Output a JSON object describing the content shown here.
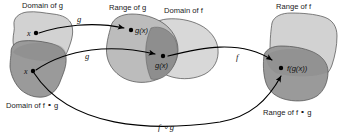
{
  "figure": {
    "background": "#ffffff"
  },
  "colors": {
    "blob_light": "#d2d2d2",
    "blob_medium": "#bcbcbc",
    "blob_dark": "#9a9a9a",
    "blob_overlap": "#8e8e8e",
    "outline": "#4a4a4a",
    "arrow": "#000000",
    "text": "#111111"
  },
  "sets": [
    {
      "id": "domain-of-g",
      "label": "Domain of g",
      "label_position": "top",
      "shade": "light",
      "point": "x"
    },
    {
      "id": "domain-of-f-comp-g",
      "label": "Domain of f ∘ g",
      "label_position": "bottom",
      "shade": "dark",
      "point": "x"
    },
    {
      "id": "range-of-g",
      "label": "Range of g",
      "label_position": "top",
      "shade": "medium",
      "point": "g(x)"
    },
    {
      "id": "domain-of-f",
      "label": "Domain of f",
      "label_position": "top",
      "shade": "light",
      "point": "g(x)"
    },
    {
      "id": "range-of-f",
      "label": "Range of f",
      "label_position": "top",
      "shade": "light",
      "point": ""
    },
    {
      "id": "range-of-f-comp-g",
      "label": "Range of f ∘ g",
      "label_position": "bottom",
      "shade": "dark",
      "point": "f(g(x))"
    }
  ],
  "points": [
    {
      "id": "x-upper",
      "label": "x",
      "x": 34,
      "y": 33
    },
    {
      "id": "x-lower",
      "label": "x",
      "x": 31,
      "y": 70
    },
    {
      "id": "gx-upper",
      "label": "g(x)",
      "x": 137,
      "y": 30
    },
    {
      "id": "gx-lower",
      "label": "g(x)",
      "x": 165,
      "y": 57
    },
    {
      "id": "fgx",
      "label": "f(g(x))",
      "x": 287,
      "y": 69
    }
  ],
  "arrows": [
    {
      "id": "arrow-g-upper",
      "label": "g",
      "from": "x-upper",
      "to": "gx-upper"
    },
    {
      "id": "arrow-g-lower",
      "label": "g",
      "from": "x-lower",
      "to": "gx-lower"
    },
    {
      "id": "arrow-f",
      "label": "f",
      "from": "gx-lower",
      "to": "fgx"
    },
    {
      "id": "arrow-f-comp-g",
      "label": "f ∘ g",
      "from": "x-lower",
      "to": "fgx"
    }
  ],
  "labels": {
    "domain_of_g": "Domain of g",
    "range_of_g": "Range of g",
    "domain_of_f": "Domain of f",
    "range_of_f": "Range of f",
    "domain_of_f_comp_g": "Domain of f ∘ g",
    "range_of_f_comp_g": "Range of f ∘ g",
    "x_upper": "x",
    "x_lower": "x",
    "gx_upper": "g(x)",
    "gx_lower": "g(x)",
    "fgx": "f(g(x))",
    "map_g_upper": "g",
    "map_g_lower": "g",
    "map_f": "f",
    "map_f_comp_g": "f ∘ g"
  }
}
